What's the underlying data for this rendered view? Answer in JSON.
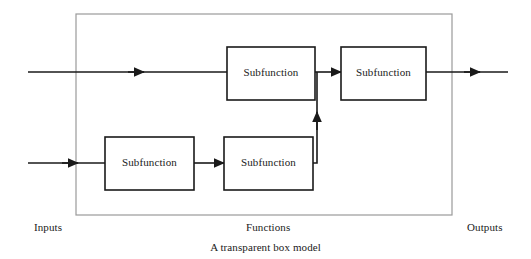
{
  "figure": {
    "caption": "A transparent box model",
    "boundary_label": "transparent box boundary"
  },
  "colors": {
    "line": "#1a1a1a",
    "frame": "#9a9a9a",
    "text": "#1a1a1a",
    "background": "#ffffff"
  },
  "regions": [
    {
      "id": "inputs",
      "label": "Inputs"
    },
    {
      "id": "functions",
      "label": "Functions"
    },
    {
      "id": "outputs",
      "label": "Outputs"
    }
  ],
  "boxes": [
    {
      "id": "subfunction-top-middle",
      "label": "Subfunction",
      "x": 227,
      "y": 47,
      "w": 88,
      "h": 53
    },
    {
      "id": "subfunction-top-right",
      "label": "Subfunction",
      "x": 341,
      "y": 47,
      "w": 85,
      "h": 53
    },
    {
      "id": "subfunction-bottom-left",
      "label": "Subfunction",
      "x": 105,
      "y": 137,
      "w": 89,
      "h": 53
    },
    {
      "id": "subfunction-bottom-middle",
      "label": "Subfunction",
      "x": 224,
      "y": 137,
      "w": 89,
      "h": 53
    }
  ],
  "connectors": [
    {
      "id": "input-top",
      "from": "inputs",
      "to": "subfunction-top-middle"
    },
    {
      "id": "input-bottom",
      "from": "inputs",
      "to": "subfunction-bottom-left"
    },
    {
      "id": "bottom-left-to-bottom-middle",
      "from": "subfunction-bottom-left",
      "to": "subfunction-bottom-middle"
    },
    {
      "id": "bottom-middle-riser",
      "from": "subfunction-bottom-middle",
      "to": "subfunction-top-right"
    },
    {
      "id": "top-middle-to-top-right",
      "from": "subfunction-top-middle",
      "to": "subfunction-top-right"
    },
    {
      "id": "output-line",
      "from": "subfunction-top-right",
      "to": "outputs"
    }
  ]
}
